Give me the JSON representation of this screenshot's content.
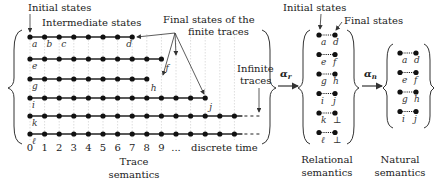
{
  "trace_semantics": {
    "annotations": {
      "initial_states": "Initial states",
      "intermediate_states": "Intermediate states",
      "final_states_line1": "Final states of the",
      "final_states_line2": "finite traces",
      "infinite_line1": "Infinite",
      "infinite_line2": "traces"
    },
    "time_ticks": [
      "0",
      "1",
      "2",
      "3",
      "4",
      "5",
      "6",
      "7",
      "8",
      "9",
      "..."
    ],
    "time_label": "discrete time",
    "caption_line1": "Trace",
    "caption_line2": "semantics",
    "traces": [
      {
        "start": "a",
        "end": "d",
        "length": 7,
        "infinite": false,
        "extra_labels": [
          "b",
          "c"
        ]
      },
      {
        "start": "e",
        "end": "f",
        "length": 9,
        "infinite": false
      },
      {
        "start": "g",
        "end": "h",
        "length": 8,
        "infinite": false
      },
      {
        "start": "i",
        "end": "j",
        "length": 12,
        "infinite": false
      },
      {
        "start": "k",
        "end": "",
        "length": 14,
        "infinite": true
      },
      {
        "start": "ℓ",
        "end": "",
        "length": 14,
        "infinite": true
      }
    ]
  },
  "arrow_alpha_r": "α",
  "arrow_alpha_r_sub": "r",
  "arrow_alpha_n": "α",
  "arrow_alpha_n_sub": "n",
  "relational_semantics": {
    "annotation_initial": "Initial states",
    "annotation_final": "Final states",
    "pairs": [
      {
        "from": "a",
        "to": "d"
      },
      {
        "from": "e",
        "to": "f"
      },
      {
        "from": "g",
        "to": "h"
      },
      {
        "from": "i",
        "to": "j"
      },
      {
        "from": "k",
        "to": "⊥"
      },
      {
        "from": "ℓ",
        "to": "⊥"
      }
    ],
    "caption_line1": "Relational",
    "caption_line2": "semantics"
  },
  "natural_semantics": {
    "pairs": [
      {
        "from": "a",
        "to": "d"
      },
      {
        "from": "e",
        "to": "f"
      },
      {
        "from": "g",
        "to": "h"
      },
      {
        "from": "i",
        "to": "j"
      }
    ],
    "caption_line1": "Natural",
    "caption_line2": "semantics"
  }
}
